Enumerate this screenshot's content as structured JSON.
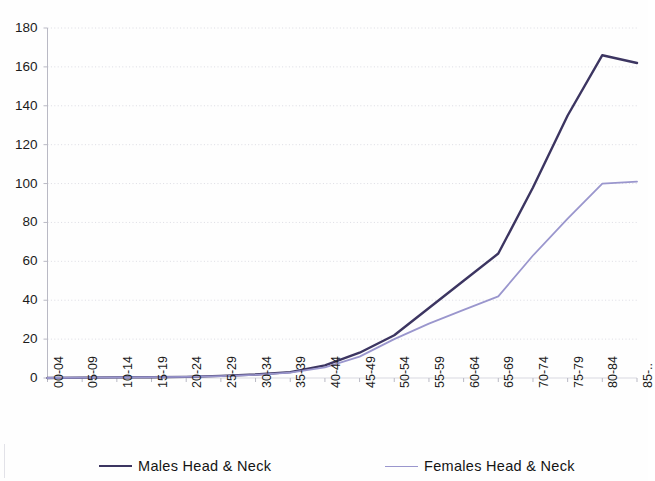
{
  "chart_data": {
    "type": "line",
    "title": "",
    "subtitle": "",
    "xlabel": "",
    "ylabel": "",
    "ylim": [
      0,
      180
    ],
    "ytick_step": 20,
    "yticks": [
      "0",
      "20",
      "40",
      "60",
      "80",
      "100",
      "120",
      "140",
      "160",
      "180"
    ],
    "grid": true,
    "grid_axis": "y",
    "legend_position": "bottom",
    "categories": [
      "00-04",
      "05-09",
      "10-14",
      "15-19",
      "20-24",
      "25-29",
      "30-34",
      "35-39",
      "40-44",
      "45-49",
      "50-54",
      "55-59",
      "60-64",
      "65-69",
      "70-74",
      "75-79",
      "80-84",
      "85-.."
    ],
    "series": [
      {
        "name": "Males  Head & Neck",
        "color": "#3c3561",
        "values": [
          0,
          0.2,
          0.3,
          0.4,
          0.6,
          1.1,
          1.8,
          3.0,
          6.5,
          13,
          22,
          36,
          50,
          64,
          98,
          135,
          166,
          162
        ]
      },
      {
        "name": "Females  Head & Neck",
        "color": "#9a96cd",
        "values": [
          0,
          0.2,
          0.3,
          0.4,
          0.6,
          1.0,
          1.6,
          2.8,
          5.5,
          11,
          20,
          28,
          35,
          42,
          63,
          82,
          100,
          101
        ]
      }
    ]
  },
  "legend": {
    "items": [
      {
        "label": "Males  Head & Neck",
        "color": "#3c3561",
        "name": "legend-item-males"
      },
      {
        "label": "Females  Head & Neck",
        "color": "#9a96cd",
        "name": "legend-item-females"
      }
    ]
  },
  "axes": {
    "y": {
      "min": 0,
      "max": 180,
      "step": 20,
      "labels": [
        "180",
        "160",
        "140",
        "120",
        "100",
        "80",
        "60",
        "40",
        "20",
        "0"
      ]
    },
    "x": {
      "labels": [
        "00-04",
        "05-09",
        "10-14",
        "15-19",
        "20-24",
        "25-29",
        "30-34",
        "35-39",
        "40-44",
        "45-49",
        "50-54",
        "55-59",
        "60-64",
        "65-69",
        "70-74",
        "75-79",
        "80-84",
        "85-.."
      ]
    }
  },
  "colors": {
    "males_line": "#3c3561",
    "females_line": "#9a96cd",
    "gridline": "#d8d8e0",
    "axis": "#b9b9c4",
    "background": "#fefefe",
    "text": "#1c1c1c"
  }
}
